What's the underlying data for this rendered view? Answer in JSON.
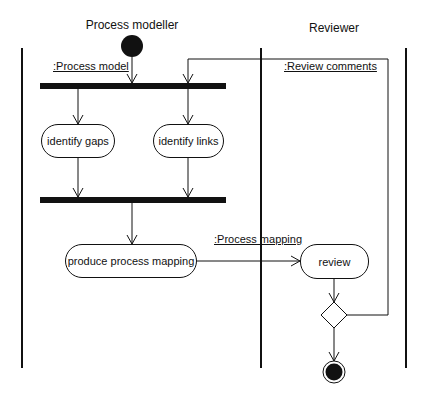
{
  "diagram": {
    "type": "UML activity diagram",
    "swimlanes": [
      {
        "title": "Process modeller"
      },
      {
        "title": "Reviewer"
      }
    ],
    "activities": [
      {
        "id": "identify-gaps",
        "label": "identify gaps"
      },
      {
        "id": "identify-links",
        "label": "identify links"
      },
      {
        "id": "produce-process-mapping",
        "label": "produce process mapping"
      },
      {
        "id": "review",
        "label": "review"
      }
    ],
    "object_flows": [
      {
        "label": ":Process model"
      },
      {
        "label": ":Review comments"
      },
      {
        "label": ":Process mapping"
      }
    ],
    "nodes": {
      "start": "initial-node",
      "fork": "fork-bar",
      "join": "join-bar",
      "decision": "decision-diamond",
      "end": "final-node"
    },
    "colors": {
      "line": "#111111",
      "background": "#ffffff"
    }
  }
}
